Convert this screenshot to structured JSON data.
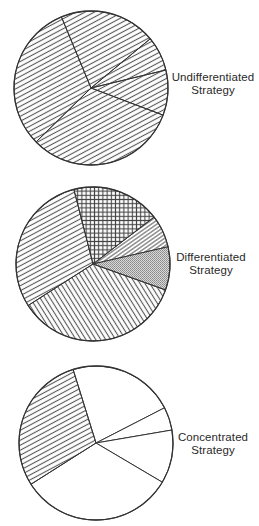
{
  "figure": {
    "stroke_color": "#333333",
    "hatch_color": "#555555",
    "stipple_color": "#8a8a8a",
    "background": "#ffffff"
  },
  "diagrams": [
    {
      "id": "undifferentiated",
      "label_line1": "Undifferentiated",
      "label_line2": "Strategy",
      "label_pos": {
        "x": 168,
        "y": 71
      },
      "center": {
        "x": 91,
        "y": 88
      },
      "radius": 77,
      "start_angle": 247.4,
      "segments": [
        {
          "name": "segment-1",
          "sweep": 72.9,
          "fill": "hatch-rising"
        },
        {
          "name": "segment-2",
          "sweep": 26.2,
          "fill": "hatch-rising"
        },
        {
          "name": "segment-3",
          "sweep": 34.1,
          "fill": "hatch-rising"
        },
        {
          "name": "segment-4",
          "sweep": 114.9,
          "fill": "hatch-rising"
        },
        {
          "name": "segment-5",
          "sweep": 111.9,
          "fill": "hatch-rising"
        }
      ]
    },
    {
      "id": "differentiated",
      "label_line1": "Differentiated",
      "label_line2": "Strategy",
      "label_pos": {
        "x": 166,
        "y": 251
      },
      "center": {
        "x": 93,
        "y": 264
      },
      "radius": 77,
      "start_angle": 255.6,
      "segments": [
        {
          "name": "segment-crosshatch",
          "sweep": 66.9,
          "fill": "crosshatch"
        },
        {
          "name": "segment-fine-diagonal",
          "sweep": 24.6,
          "fill": "hatch-fine"
        },
        {
          "name": "segment-stipple",
          "sweep": 32.6,
          "fill": "stipple"
        },
        {
          "name": "segment-falling-diagonal",
          "sweep": 127.7,
          "fill": "hatch-falling"
        },
        {
          "name": "segment-rising-hatch",
          "sweep": 108.2,
          "fill": "hatch-rising"
        }
      ]
    },
    {
      "id": "concentrated",
      "label_line1": "Concentrated",
      "label_line2": "Strategy",
      "label_pos": {
        "x": 168,
        "y": 431
      },
      "center": {
        "x": 96,
        "y": 443
      },
      "radius": 77,
      "start_angle": 252.7,
      "segments": [
        {
          "name": "segment-1",
          "sweep": 80.1,
          "fill": "none"
        },
        {
          "name": "segment-2",
          "sweep": 17.5,
          "fill": "none"
        },
        {
          "name": "segment-3",
          "sweep": 40.3,
          "fill": "none"
        },
        {
          "name": "segment-4",
          "sweep": 117.0,
          "fill": "none"
        },
        {
          "name": "segment-target",
          "sweep": 105.1,
          "fill": "hatch-rising"
        }
      ]
    }
  ]
}
